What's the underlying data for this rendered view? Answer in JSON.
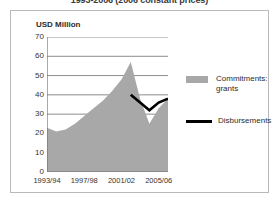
{
  "chart_title": "1993-2006 (2006 constant prices)",
  "axis_unit_label": "USD Million",
  "legend": {
    "items": [
      {
        "label": "Commitments:\ngrants",
        "marker": "area-swatch",
        "color": "#a8a8a8"
      },
      {
        "label": "Disbursements",
        "marker": "line-swatch",
        "color": "#000000"
      }
    ]
  },
  "colors": {
    "area_fill": "#a8a8a8",
    "line_stroke": "#000000",
    "gridline": "#8c8c8c",
    "axis": "#6f6f6f",
    "frame_border": "#b9b9b9",
    "text": "#333333",
    "background": "#ffffff"
  },
  "chart_data": {
    "type": "area",
    "title": "1993-2006 (2006 constant prices)",
    "xlabel": "",
    "ylabel": "USD Million",
    "ylim": [
      0,
      70
    ],
    "ytick_labels": [
      "0",
      "10",
      "20",
      "30",
      "40",
      "50",
      "60",
      "70"
    ],
    "ytick_values": [
      0,
      10,
      20,
      30,
      40,
      50,
      60,
      70
    ],
    "grid": true,
    "legend_position": "right",
    "x": [
      "1993/94",
      "1994/95",
      "1995/96",
      "1996/97",
      "1997/98",
      "1998/99",
      "1999/00",
      "2000/01",
      "2001/02",
      "2002/03",
      "2003/04",
      "2004/05",
      "2005/06",
      "2006/07"
    ],
    "xtick_labels": [
      "1993/94",
      "1997/98",
      "2001/02",
      "2005/06"
    ],
    "xtick_indices": [
      0,
      4,
      8,
      12
    ],
    "series": [
      {
        "name": "Commitments: grants",
        "type": "area",
        "color": "#a8a8a8",
        "values": [
          23,
          21,
          22,
          25,
          29,
          33,
          37,
          42,
          48,
          57,
          38,
          25,
          33,
          38
        ]
      },
      {
        "name": "Disbursements",
        "type": "line",
        "color": "#000000",
        "start_index": 9,
        "values": [
          null,
          null,
          null,
          null,
          null,
          null,
          null,
          null,
          null,
          40,
          36,
          32,
          36,
          38
        ]
      }
    ]
  }
}
